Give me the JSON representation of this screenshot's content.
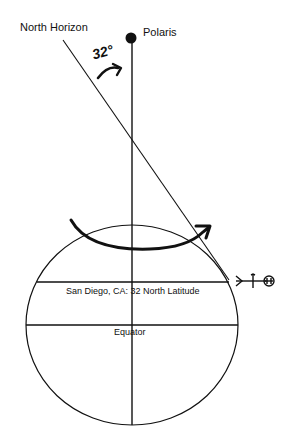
{
  "diagram": {
    "labels": {
      "north_horizon": "North Horizon",
      "polaris": "Polaris",
      "angle": "32°",
      "latitude_line": "San Diego, CA: 32 North Latitude",
      "equator": "Equator"
    },
    "elements": {
      "earth_circle": "earth-globe",
      "polar_axis": "vertical-axis-to-polaris",
      "horizon_line": "tangent-north-horizon",
      "rotation_arrow": "earth-rotation-arrow",
      "angle_arrow": "angle-arc-arrow",
      "observer_symbol": "observer-marker"
    },
    "colors": {
      "line": "#111111",
      "background": "#ffffff"
    }
  }
}
